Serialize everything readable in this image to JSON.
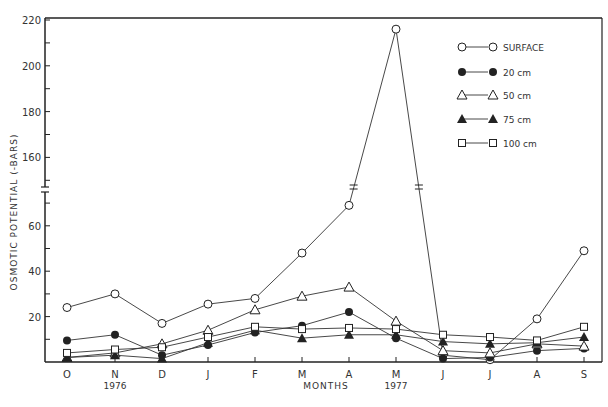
{
  "chart_data": {
    "type": "line",
    "title": "",
    "xlabel": "MONTHS",
    "ylabel": "OSMOTIC POTENTIAL (-BARS)",
    "x": [
      "O",
      "N",
      "D",
      "J",
      "F",
      "M",
      "A",
      "M",
      "J",
      "J",
      "A",
      "S"
    ],
    "year_labels": [
      {
        "label": "1976",
        "at_index": 1
      },
      {
        "label": "1977",
        "at_index": 7
      }
    ],
    "y_ticks_lower": [
      20,
      40,
      60
    ],
    "y_ticks_upper": [
      160,
      180,
      200,
      220
    ],
    "y_axis_break": "between 70 and 150",
    "ylim": [
      0,
      220
    ],
    "grid": false,
    "legend_position": "upper right inside",
    "series": [
      {
        "name": "SURFACE",
        "marker": "open-circle",
        "values": [
          24,
          30,
          17,
          25.5,
          28,
          48,
          69,
          216,
          3,
          1,
          19,
          49
        ]
      },
      {
        "name": "20 cm",
        "marker": "filled-circle",
        "values": [
          9.5,
          12,
          3,
          7.5,
          13,
          16,
          22,
          10.5,
          1.5,
          2,
          5,
          6
        ]
      },
      {
        "name": "50 cm",
        "marker": "open-triangle",
        "values": [
          2,
          4,
          8,
          14,
          23,
          29,
          33,
          18,
          5,
          4,
          8,
          7
        ]
      },
      {
        "name": "75 cm",
        "marker": "filled-triangle",
        "values": [
          2,
          3,
          1.5,
          8.5,
          14,
          10.5,
          12,
          12,
          9,
          8,
          8.5,
          11
        ]
      },
      {
        "name": "100 cm",
        "marker": "open-square",
        "values": [
          4,
          5.5,
          6.5,
          11,
          15.5,
          14.5,
          15,
          14.5,
          12,
          11,
          9.5,
          15.5
        ]
      }
    ]
  },
  "labels": {
    "xlabel": "MONTHS",
    "ylabel": "OSMOTIC   POTENTIAL   (-BARS)",
    "year1": "1976",
    "year2": "1977"
  },
  "legend": [
    "SURFACE",
    "20 cm",
    "50 cm",
    "75 cm",
    "100 cm"
  ]
}
